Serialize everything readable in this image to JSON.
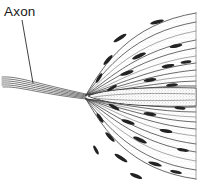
{
  "figure": {
    "background_color": "#ffffff",
    "ink_color": "#2a2a2a",
    "width": 203,
    "height": 189
  },
  "labels": [
    {
      "id": "axon",
      "text": "Axon",
      "x": 4,
      "y": 16,
      "leader": {
        "from_x": 22,
        "from_y": 20,
        "to_x": 33,
        "to_y": 83
      }
    }
  ],
  "diagram": {
    "type": "line-drawing",
    "convergence_point": {
      "x": 86,
      "y": 96
    },
    "axon_entry": {
      "x": 2,
      "y": 80
    },
    "fan_span_top": 12,
    "fan_span_bottom": 178,
    "right_edge_rule": {
      "x": 196,
      "y_top": 12,
      "y_bottom": 180
    },
    "upper_fiber_count": 11,
    "lower_fiber_count": 11,
    "central_body": {
      "name": "stippled-lens-body",
      "left_x": 88,
      "right_x": 196,
      "center_y": 97,
      "half_height": 8
    },
    "nucleus_count": 26
  },
  "chart_data": {
    "type": "line",
    "xlabel": "",
    "ylabel": "",
    "upper_fibers": [
      {
        "sx": 86,
        "sy": 95,
        "c1x": 104,
        "c1y": 64,
        "c2x": 130,
        "c2y": 24,
        "ex": 196,
        "ey": 13
      },
      {
        "sx": 86,
        "sy": 95,
        "c1x": 106,
        "c1y": 69,
        "c2x": 133,
        "c2y": 33,
        "ex": 196,
        "ey": 22
      },
      {
        "sx": 86,
        "sy": 95,
        "c1x": 108,
        "c1y": 74,
        "c2x": 136,
        "c2y": 42,
        "ex": 196,
        "ey": 31
      },
      {
        "sx": 86,
        "sy": 95,
        "c1x": 110,
        "c1y": 78,
        "c2x": 139,
        "c2y": 50,
        "ex": 196,
        "ey": 40
      },
      {
        "sx": 86,
        "sy": 95,
        "c1x": 112,
        "c1y": 81,
        "c2x": 142,
        "c2y": 57,
        "ex": 196,
        "ey": 48
      },
      {
        "sx": 86,
        "sy": 95,
        "c1x": 114,
        "c1y": 84,
        "c2x": 145,
        "c2y": 63,
        "ex": 196,
        "ey": 56
      },
      {
        "sx": 86,
        "sy": 95,
        "c1x": 116,
        "c1y": 86,
        "c2x": 148,
        "c2y": 69,
        "ex": 196,
        "ey": 63
      },
      {
        "sx": 86,
        "sy": 95,
        "c1x": 118,
        "c1y": 88,
        "c2x": 151,
        "c2y": 74,
        "ex": 196,
        "ey": 70
      },
      {
        "sx": 86,
        "sy": 95,
        "c1x": 120,
        "c1y": 89,
        "c2x": 154,
        "c2y": 78,
        "ex": 196,
        "ey": 76
      },
      {
        "sx": 86,
        "sy": 95,
        "c1x": 122,
        "c1y": 90,
        "c2x": 157,
        "c2y": 82,
        "ex": 196,
        "ey": 81
      },
      {
        "sx": 86,
        "sy": 95,
        "c1x": 124,
        "c1y": 91,
        "c2x": 160,
        "c2y": 85,
        "ex": 196,
        "ey": 86
      }
    ],
    "lower_fibers": [
      {
        "sx": 86,
        "sy": 99,
        "c1x": 104,
        "c1y": 130,
        "c2x": 130,
        "c2y": 170,
        "ex": 196,
        "ey": 179
      },
      {
        "sx": 86,
        "sy": 99,
        "c1x": 106,
        "c1y": 125,
        "c2x": 133,
        "c2y": 161,
        "ex": 196,
        "ey": 170
      },
      {
        "sx": 86,
        "sy": 99,
        "c1x": 108,
        "c1y": 120,
        "c2x": 136,
        "c2y": 152,
        "ex": 196,
        "ey": 161
      },
      {
        "sx": 86,
        "sy": 99,
        "c1x": 110,
        "c1y": 116,
        "c2x": 139,
        "c2y": 144,
        "ex": 196,
        "ey": 152
      },
      {
        "sx": 86,
        "sy": 99,
        "c1x": 112,
        "c1y": 113,
        "c2x": 142,
        "c2y": 137,
        "ex": 196,
        "ey": 144
      },
      {
        "sx": 86,
        "sy": 99,
        "c1x": 114,
        "c1y": 110,
        "c2x": 145,
        "c2y": 131,
        "ex": 196,
        "ey": 136
      },
      {
        "sx": 86,
        "sy": 99,
        "c1x": 116,
        "c1y": 108,
        "c2x": 148,
        "c2y": 125,
        "ex": 196,
        "ey": 129
      },
      {
        "sx": 86,
        "sy": 99,
        "c1x": 118,
        "c1y": 106,
        "c2x": 151,
        "c2y": 120,
        "ex": 196,
        "ey": 122
      },
      {
        "sx": 86,
        "sy": 99,
        "c1x": 120,
        "c1y": 105,
        "c2x": 154,
        "c2y": 116,
        "ex": 196,
        "ey": 117
      },
      {
        "sx": 86,
        "sy": 99,
        "c1x": 122,
        "c1y": 104,
        "c2x": 157,
        "c2y": 112,
        "ex": 196,
        "ey": 112
      },
      {
        "sx": 86,
        "sy": 99,
        "c1x": 124,
        "c1y": 103,
        "c2x": 160,
        "c2y": 109,
        "ex": 196,
        "ey": 107
      }
    ],
    "nuclei": [
      {
        "x": 120,
        "y": 38,
        "rx": 7.5,
        "ry": 1.9,
        "rot": -32
      },
      {
        "x": 157,
        "y": 22,
        "rx": 7.0,
        "ry": 1.8,
        "rot": -14
      },
      {
        "x": 176,
        "y": 46,
        "rx": 6.5,
        "ry": 1.7,
        "rot": -11
      },
      {
        "x": 139,
        "y": 56,
        "rx": 7.5,
        "ry": 1.9,
        "rot": -24
      },
      {
        "x": 108,
        "y": 60,
        "rx": 6.5,
        "ry": 1.8,
        "rot": -48
      },
      {
        "x": 168,
        "y": 66,
        "rx": 6.5,
        "ry": 1.7,
        "rot": -9
      },
      {
        "x": 127,
        "y": 73,
        "rx": 7.0,
        "ry": 1.8,
        "rot": -18
      },
      {
        "x": 99,
        "y": 78,
        "rx": 5.5,
        "ry": 1.6,
        "rot": -58
      },
      {
        "x": 150,
        "y": 80,
        "rx": 6.5,
        "ry": 1.7,
        "rot": -8
      },
      {
        "x": 186,
        "y": 62,
        "rx": 5.5,
        "ry": 1.6,
        "rot": -8
      },
      {
        "x": 112,
        "y": 88,
        "rx": 5.5,
        "ry": 1.5,
        "rot": -30
      },
      {
        "x": 172,
        "y": 85,
        "rx": 6.0,
        "ry": 1.6,
        "rot": -5
      },
      {
        "x": 114,
        "y": 107,
        "rx": 6.0,
        "ry": 1.6,
        "rot": 28
      },
      {
        "x": 150,
        "y": 114,
        "rx": 6.5,
        "ry": 1.7,
        "rot": 8
      },
      {
        "x": 180,
        "y": 108,
        "rx": 5.5,
        "ry": 1.6,
        "rot": 5
      },
      {
        "x": 128,
        "y": 122,
        "rx": 7.0,
        "ry": 1.8,
        "rot": 18
      },
      {
        "x": 100,
        "y": 118,
        "rx": 5.5,
        "ry": 1.6,
        "rot": 55
      },
      {
        "x": 166,
        "y": 131,
        "rx": 6.5,
        "ry": 1.7,
        "rot": 10
      },
      {
        "x": 140,
        "y": 140,
        "rx": 7.5,
        "ry": 1.9,
        "rot": 24
      },
      {
        "x": 110,
        "y": 137,
        "rx": 6.5,
        "ry": 1.8,
        "rot": 46
      },
      {
        "x": 183,
        "y": 150,
        "rx": 6.0,
        "ry": 1.6,
        "rot": 10
      },
      {
        "x": 121,
        "y": 158,
        "rx": 7.5,
        "ry": 1.9,
        "rot": 32
      },
      {
        "x": 155,
        "y": 164,
        "rx": 7.0,
        "ry": 1.8,
        "rot": 16
      },
      {
        "x": 176,
        "y": 172,
        "rx": 6.0,
        "ry": 1.6,
        "rot": 11
      },
      {
        "x": 136,
        "y": 176,
        "rx": 6.5,
        "ry": 1.8,
        "rot": 22
      },
      {
        "x": 96,
        "y": 150,
        "rx": 5.0,
        "ry": 1.5,
        "rot": 62
      }
    ],
    "axon_strands": [
      {
        "sx": 2,
        "sy": 77,
        "c1x": 18,
        "c1y": 76,
        "c2x": 34,
        "c2y": 83,
        "ex": 86,
        "ey": 94
      },
      {
        "sx": 2,
        "sy": 79,
        "c1x": 18,
        "c1y": 78,
        "c2x": 34,
        "c2y": 85,
        "ex": 86,
        "ey": 95
      },
      {
        "sx": 2,
        "sy": 81,
        "c1x": 18,
        "c1y": 80,
        "c2x": 34,
        "c2y": 87,
        "ex": 86,
        "ey": 96
      },
      {
        "sx": 2,
        "sy": 83,
        "c1x": 18,
        "c1y": 82,
        "c2x": 34,
        "c2y": 89,
        "ex": 86,
        "ey": 97
      },
      {
        "sx": 2,
        "sy": 85,
        "c1x": 18,
        "c1y": 84,
        "c2x": 34,
        "c2y": 91,
        "ex": 86,
        "ey": 98
      },
      {
        "sx": 3,
        "sy": 87,
        "c1x": 19,
        "c1y": 86,
        "c2x": 35,
        "c2y": 93,
        "ex": 86,
        "ey": 99
      }
    ]
  }
}
